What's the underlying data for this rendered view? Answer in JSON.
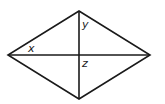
{
  "diagram": {
    "type": "rhombus-with-diagonals",
    "stroke_color": "#1a1a1a",
    "vertices": {
      "top": [
        79,
        11
      ],
      "right": [
        150,
        55
      ],
      "bottom": [
        79,
        99
      ],
      "left": [
        8,
        55
      ]
    },
    "center": [
      79,
      55
    ],
    "labels": {
      "x": "x",
      "y": "y",
      "z": "z"
    }
  }
}
